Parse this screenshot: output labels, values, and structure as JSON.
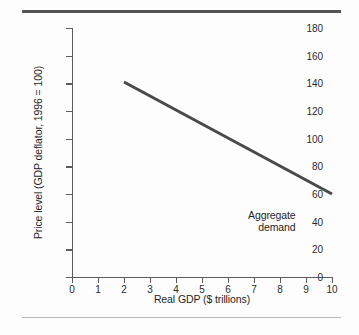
{
  "figure": {
    "top_rule_color": "#545454",
    "bottom_rule_color": "#b9b9b9",
    "background_color": "#fdfdfd"
  },
  "chart_data": {
    "type": "line",
    "title": "",
    "xlabel": "Real GDP ($ trillions)",
    "ylabel": "Price level (GDP deflator, 1996 = 100)",
    "xlim": [
      0,
      10
    ],
    "ylim": [
      0,
      180
    ],
    "xticks": [
      0,
      1,
      2,
      3,
      4,
      5,
      6,
      7,
      8,
      9,
      10
    ],
    "xticklabels": [
      "0",
      "1",
      "2",
      "3",
      "4",
      "5",
      "6",
      "7",
      "8",
      "9",
      "10"
    ],
    "yticks": [
      0,
      20,
      40,
      60,
      80,
      100,
      120,
      140,
      160,
      180
    ],
    "yticklabels": [
      "0",
      "20",
      "40",
      "60",
      "80",
      "100",
      "120",
      "140",
      "160",
      "180"
    ],
    "grid": false,
    "legend": "none",
    "series": [
      {
        "name": "Aggregate demand",
        "color": "#4a4a4a",
        "linewidth": 3,
        "x": [
          2,
          10
        ],
        "y": [
          141,
          60
        ]
      }
    ],
    "annotations": [
      {
        "text_line1": "Aggregate",
        "text_line2": "demand",
        "x": 8.6,
        "y": 45,
        "align": "right"
      }
    ]
  }
}
